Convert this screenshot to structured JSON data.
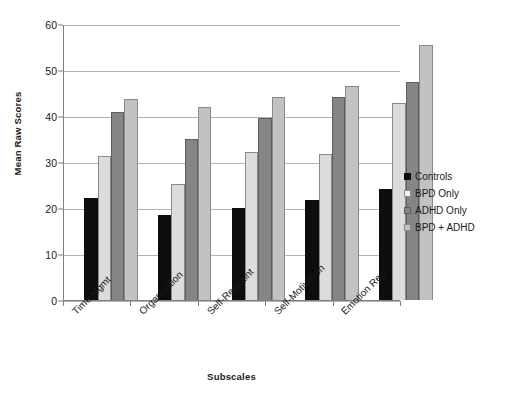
{
  "chart_data": {
    "type": "bar",
    "title": "",
    "xlabel": "Subscales",
    "ylabel": "Mean Raw Scores",
    "ylim": [
      0,
      60
    ],
    "yticks": [
      0,
      10,
      20,
      30,
      40,
      50,
      60
    ],
    "grid": true,
    "legend_position": "right",
    "categories": [
      "Time Mgmt",
      "Organization",
      "Self-Restraint",
      "Self-Motivation",
      "Emotion Reg."
    ],
    "series": [
      {
        "name": "Controls",
        "color": "#0d0d0d",
        "values": [
          22.3,
          18.6,
          20.1,
          21.9,
          24.3
        ]
      },
      {
        "name": "BPD Only",
        "color": "#dcdcdc",
        "values": [
          31.5,
          25.4,
          32.4,
          31.9,
          42.9
        ]
      },
      {
        "name": "ADHD Only",
        "color": "#858585",
        "values": [
          41.0,
          35.2,
          39.7,
          44.4,
          47.6
        ]
      },
      {
        "name": "BPD + ADHD",
        "color": "#c2c2c2",
        "values": [
          43.9,
          42.2,
          44.2,
          46.6,
          55.7
        ]
      }
    ]
  }
}
